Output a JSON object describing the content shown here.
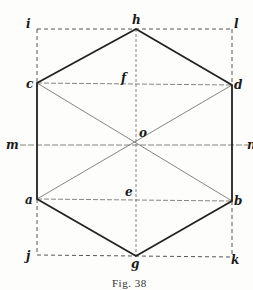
{
  "caption": "Fig. 38",
  "labels": {
    "i": "i",
    "h": "h",
    "l": "l",
    "c": "c",
    "f": "f",
    "d": "d",
    "m": "m",
    "o": "o",
    "n": "n",
    "a": "a",
    "e": "e",
    "b": "b",
    "j": "j",
    "g": "g",
    "k": "k"
  },
  "colors": {
    "ink": "#1a1a1a",
    "background": "#fdfdfb"
  }
}
